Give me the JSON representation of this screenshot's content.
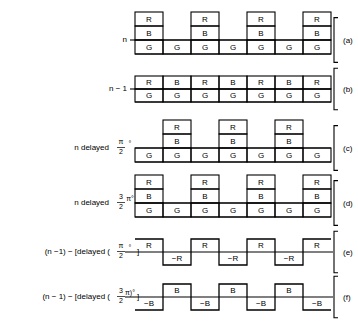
{
  "figure": {
    "line_color": "#000000",
    "background": "#ffffff",
    "grid": {
      "x_start": 135,
      "cell_width": 28,
      "cell_count": 7
    }
  },
  "rows": [
    {
      "id": "a",
      "panel_label": "(a)",
      "left_label": "n",
      "left_label_parts": {
        "text": "n"
      },
      "kind": "stack",
      "baseline_note": "RBG stacks on odd cells, G on even cells",
      "cells": [
        {
          "index": 1,
          "above": [
            "R",
            "B"
          ],
          "below": [
            "G"
          ]
        },
        {
          "index": 2,
          "above": [],
          "below": [
            "G"
          ]
        },
        {
          "index": 3,
          "above": [
            "R",
            "B"
          ],
          "below": [
            "G"
          ]
        },
        {
          "index": 4,
          "above": [],
          "below": [
            "G"
          ]
        },
        {
          "index": 5,
          "above": [
            "R",
            "B"
          ],
          "below": [
            "G"
          ]
        },
        {
          "index": 6,
          "above": [],
          "below": [
            "G"
          ]
        },
        {
          "index": 7,
          "above": [
            "R",
            "B"
          ],
          "below": [
            "G"
          ]
        }
      ]
    },
    {
      "id": "b",
      "panel_label": "(b)",
      "left_label": "n − 1",
      "kind": "stack",
      "baseline_note": "Alternating R/B above baseline, G below on every cell",
      "cells": [
        {
          "index": 1,
          "above": [
            "R"
          ],
          "below": [
            "G"
          ]
        },
        {
          "index": 2,
          "above": [
            "B"
          ],
          "below": [
            "G"
          ]
        },
        {
          "index": 3,
          "above": [
            "R"
          ],
          "below": [
            "G"
          ]
        },
        {
          "index": 4,
          "above": [
            "B"
          ],
          "below": [
            "G"
          ]
        },
        {
          "index": 5,
          "above": [
            "R"
          ],
          "below": [
            "G"
          ]
        },
        {
          "index": 6,
          "above": [
            "B"
          ],
          "below": [
            "G"
          ]
        },
        {
          "index": 7,
          "above": [
            "R"
          ],
          "below": [
            "G"
          ]
        }
      ]
    },
    {
      "id": "c",
      "panel_label": "(c)",
      "left_label": "n delayed",
      "fraction": {
        "numerator": "π",
        "denominator": "2",
        "suffix": "°"
      },
      "kind": "stack",
      "baseline_note": "RBG stacks on even cells, G on odd cells",
      "cells": [
        {
          "index": 1,
          "above": [],
          "below": [
            "G"
          ]
        },
        {
          "index": 2,
          "above": [
            "R",
            "B"
          ],
          "below": [
            "G"
          ]
        },
        {
          "index": 3,
          "above": [],
          "below": [
            "G"
          ]
        },
        {
          "index": 4,
          "above": [
            "R",
            "B"
          ],
          "below": [
            "G"
          ]
        },
        {
          "index": 5,
          "above": [],
          "below": [
            "G"
          ]
        },
        {
          "index": 6,
          "above": [
            "R",
            "B"
          ],
          "below": [
            "G"
          ]
        },
        {
          "index": 7,
          "above": [],
          "below": [
            "G"
          ]
        }
      ]
    },
    {
      "id": "d",
      "panel_label": "(d)",
      "left_label": "n delayed",
      "fraction": {
        "numerator": "3",
        "denominator": "2",
        "suffix": "π°"
      },
      "kind": "stack",
      "baseline_note": "RBG stacks on odd cells, G on even cells",
      "cells": [
        {
          "index": 1,
          "above": [
            "R",
            "B"
          ],
          "below": [
            "G"
          ]
        },
        {
          "index": 2,
          "above": [],
          "below": [
            "G"
          ]
        },
        {
          "index": 3,
          "above": [
            "R",
            "B"
          ],
          "below": [
            "G"
          ]
        },
        {
          "index": 4,
          "above": [],
          "below": [
            "G"
          ]
        },
        {
          "index": 5,
          "above": [
            "R",
            "B"
          ],
          "below": [
            "G"
          ]
        },
        {
          "index": 6,
          "above": [],
          "below": [
            "G"
          ]
        },
        {
          "index": 7,
          "above": [
            "R",
            "B"
          ],
          "below": [
            "G"
          ]
        }
      ]
    },
    {
      "id": "e",
      "panel_label": "(e)",
      "left_label_prefix": "(n −1) − [delayed (",
      "fraction": {
        "numerator": "π",
        "denominator": "2",
        "suffix": "°"
      },
      "left_label_suffix": "]",
      "kind": "square",
      "baseline_note": "Square wave: R above on odd cells, −R below on even cells",
      "cells": [
        {
          "index": 1,
          "level": "up",
          "label": "R"
        },
        {
          "index": 2,
          "level": "down",
          "label": "−R"
        },
        {
          "index": 3,
          "level": "up",
          "label": "R"
        },
        {
          "index": 4,
          "level": "down",
          "label": "−R"
        },
        {
          "index": 5,
          "level": "up",
          "label": "R"
        },
        {
          "index": 6,
          "level": "down",
          "label": "−R"
        },
        {
          "index": 7,
          "level": "up",
          "label": "R"
        }
      ]
    },
    {
      "id": "f",
      "panel_label": "(f)",
      "left_label_prefix": "(n − 1) − [delayed (",
      "fraction": {
        "numerator": "3",
        "denominator": "2",
        "suffix": "π)°"
      },
      "left_label_suffix": "]",
      "kind": "square",
      "baseline_note": "Square wave: −B below on odd cells, B above on even cells",
      "cells": [
        {
          "index": 1,
          "level": "down",
          "label": "−B"
        },
        {
          "index": 2,
          "level": "up",
          "label": "B"
        },
        {
          "index": 3,
          "level": "down",
          "label": "−B"
        },
        {
          "index": 4,
          "level": "up",
          "label": "B"
        },
        {
          "index": 5,
          "level": "down",
          "label": "−B"
        },
        {
          "index": 6,
          "level": "up",
          "label": "B"
        },
        {
          "index": 7,
          "level": "down",
          "label": "−B"
        }
      ]
    }
  ]
}
